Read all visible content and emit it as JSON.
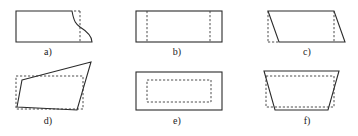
{
  "figure": {
    "panels": [
      {
        "id": "a",
        "label": "a)",
        "description": "rectangle with curved cutout on right edge, dashed vertical line"
      },
      {
        "id": "b",
        "label": "b)",
        "description": "rectangle with two dashed vertical lines near left and right edges"
      },
      {
        "id": "c",
        "label": "c)",
        "description": "parallelogram with dashed vertical projections at both sides"
      },
      {
        "id": "d",
        "label": "d)",
        "description": "irregular quadrilateral overlaid on dashed rectangle"
      },
      {
        "id": "e",
        "label": "e)",
        "description": "rectangle with inset dashed rectangle"
      },
      {
        "id": "f",
        "label": "f)",
        "description": "trapezoid (wide top) with dashed rectangle inside"
      }
    ]
  }
}
